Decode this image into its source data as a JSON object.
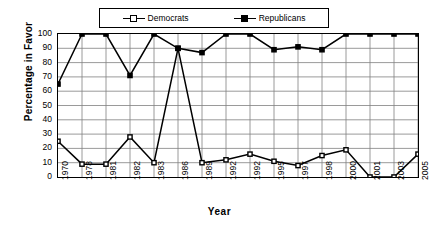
{
  "chart_data": {
    "type": "line",
    "title": "",
    "xlabel": "Year",
    "ylabel": "Percentage in Favor",
    "ylim": [
      0,
      100
    ],
    "ytick_step": 10,
    "yticks": [
      0,
      10,
      20,
      30,
      40,
      50,
      60,
      70,
      80,
      90,
      100
    ],
    "grid": true,
    "legend_position": "top-center",
    "categories": [
      "1970",
      "1978",
      "1981",
      "1982",
      "1983",
      "1986",
      "1989",
      "1992",
      "1992",
      "1995",
      "1997",
      "1998",
      "2000",
      "2001",
      "2003",
      "2005"
    ],
    "series": [
      {
        "name": "Democrats",
        "marker": "hollow-square",
        "color": "#000000",
        "values": [
          25,
          9,
          9,
          28,
          10,
          90,
          10,
          12,
          16,
          11,
          8,
          15,
          19,
          0,
          0,
          16
        ]
      },
      {
        "name": "Republicans",
        "marker": "solid-square",
        "color": "#000000",
        "values": [
          65,
          100,
          100,
          71,
          100,
          90,
          87,
          100,
          100,
          89,
          91,
          89,
          100,
          100,
          100,
          100
        ]
      }
    ]
  },
  "legend": {
    "entries": [
      {
        "label": "Democrats"
      },
      {
        "label": "Republicans"
      }
    ]
  },
  "axes": {
    "y_title": "Percentage in Favor",
    "x_title": "Year"
  },
  "colors": {
    "line": "#000000",
    "grid": "#808080",
    "axis": "#000000",
    "background": "#ffffff"
  }
}
